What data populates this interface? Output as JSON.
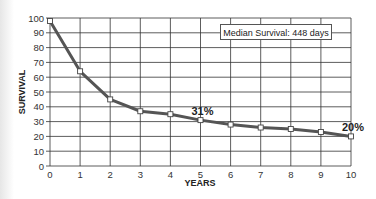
{
  "chart_data": {
    "type": "line",
    "title": "",
    "xlabel": "YEARS",
    "ylabel": "SURVIVAL",
    "x": [
      0,
      1,
      2,
      3,
      4,
      5,
      6,
      7,
      8,
      9,
      10
    ],
    "series": [
      {
        "name": "Survival",
        "values": [
          98,
          64,
          45,
          37,
          35,
          31,
          28,
          26,
          25,
          23,
          20
        ]
      }
    ],
    "xlim": [
      0,
      10
    ],
    "ylim": [
      0,
      100
    ],
    "xticks": [
      "0",
      "1",
      "2",
      "3",
      "4",
      "5",
      "6",
      "7",
      "8",
      "9",
      "10"
    ],
    "yticks": [
      "0",
      "10",
      "20",
      "30",
      "40",
      "50",
      "60",
      "70",
      "80",
      "90",
      "100"
    ],
    "grid": true,
    "annotations": [
      {
        "text": "31%",
        "x": 5,
        "y": 31
      },
      {
        "text": "20%",
        "x": 10,
        "y": 20
      }
    ],
    "legend_text": "Median Survival: 448 days",
    "colors": {
      "line": "#555555",
      "grid": "#333333",
      "marker_fill": "#ffffff"
    }
  }
}
